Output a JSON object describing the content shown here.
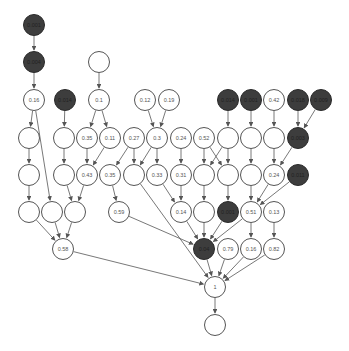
{
  "colors": {
    "light_fill": "#ffffff",
    "dark_fill": "#3d3d3d",
    "stroke": "#555555"
  },
  "nodes": [
    {
      "id": "n0",
      "x": 34,
      "y": 25,
      "label": "0.001",
      "dark": true
    },
    {
      "id": "n1",
      "x": 34,
      "y": 62,
      "label": "0.004",
      "dark": true
    },
    {
      "id": "n2",
      "x": 99,
      "y": 62,
      "label": "",
      "dark": false
    },
    {
      "id": "n3",
      "x": 34,
      "y": 100,
      "label": "0.16",
      "dark": false
    },
    {
      "id": "n4",
      "x": 65,
      "y": 100,
      "label": "0.014",
      "dark": true
    },
    {
      "id": "n5",
      "x": 99,
      "y": 100,
      "label": "0.1",
      "dark": false
    },
    {
      "id": "n6",
      "x": 145,
      "y": 100,
      "label": "0.12",
      "dark": false
    },
    {
      "id": "n7",
      "x": 169,
      "y": 100,
      "label": "0.19",
      "dark": false
    },
    {
      "id": "n8",
      "x": 228,
      "y": 100,
      "label": "0.014",
      "dark": true
    },
    {
      "id": "n9",
      "x": 251,
      "y": 100,
      "label": "0.001",
      "dark": true
    },
    {
      "id": "n10",
      "x": 274,
      "y": 100,
      "label": "0.42",
      "dark": false
    },
    {
      "id": "n11",
      "x": 298,
      "y": 100,
      "label": "0.018",
      "dark": true
    },
    {
      "id": "n12",
      "x": 321,
      "y": 100,
      "label": "0.009",
      "dark": true
    },
    {
      "id": "n13",
      "x": 29,
      "y": 138,
      "label": "",
      "dark": false
    },
    {
      "id": "n14",
      "x": 64,
      "y": 138,
      "label": "",
      "dark": false
    },
    {
      "id": "n15",
      "x": 87,
      "y": 138,
      "label": "0.35",
      "dark": false
    },
    {
      "id": "n16",
      "x": 110,
      "y": 138,
      "label": "0.11",
      "dark": false
    },
    {
      "id": "n17",
      "x": 134,
      "y": 138,
      "label": "0.27",
      "dark": false
    },
    {
      "id": "n18",
      "x": 157,
      "y": 138,
      "label": "0.3",
      "dark": false
    },
    {
      "id": "n19",
      "x": 181,
      "y": 138,
      "label": "0.24",
      "dark": false
    },
    {
      "id": "n20",
      "x": 204,
      "y": 138,
      "label": "0.52",
      "dark": false
    },
    {
      "id": "n21",
      "x": 228,
      "y": 138,
      "label": "",
      "dark": false
    },
    {
      "id": "n22",
      "x": 251,
      "y": 138,
      "label": "",
      "dark": false
    },
    {
      "id": "n23",
      "x": 274,
      "y": 138,
      "label": "",
      "dark": false
    },
    {
      "id": "n24",
      "x": 298,
      "y": 138,
      "label": "0.003",
      "dark": true
    },
    {
      "id": "n25",
      "x": 29,
      "y": 175,
      "label": "",
      "dark": false
    },
    {
      "id": "n26",
      "x": 64,
      "y": 175,
      "label": "",
      "dark": false
    },
    {
      "id": "n27",
      "x": 87,
      "y": 175,
      "label": "0.43",
      "dark": false
    },
    {
      "id": "n28",
      "x": 110,
      "y": 175,
      "label": "0.35",
      "dark": false
    },
    {
      "id": "n29",
      "x": 134,
      "y": 175,
      "label": "",
      "dark": false
    },
    {
      "id": "n30",
      "x": 157,
      "y": 175,
      "label": "0.33",
      "dark": false
    },
    {
      "id": "n31",
      "x": 181,
      "y": 175,
      "label": "0.31",
      "dark": false
    },
    {
      "id": "n32",
      "x": 204,
      "y": 175,
      "label": "",
      "dark": false
    },
    {
      "id": "n33",
      "x": 228,
      "y": 175,
      "label": "",
      "dark": false
    },
    {
      "id": "n34",
      "x": 251,
      "y": 175,
      "label": "",
      "dark": false
    },
    {
      "id": "n35",
      "x": 274,
      "y": 175,
      "label": "0.24",
      "dark": false
    },
    {
      "id": "n36",
      "x": 298,
      "y": 175,
      "label": "0.011",
      "dark": true
    },
    {
      "id": "n37",
      "x": 29,
      "y": 212,
      "label": "",
      "dark": false
    },
    {
      "id": "n38",
      "x": 52,
      "y": 212,
      "label": "",
      "dark": false
    },
    {
      "id": "n39",
      "x": 75,
      "y": 212,
      "label": "",
      "dark": false
    },
    {
      "id": "n40",
      "x": 119,
      "y": 212,
      "label": "0.59",
      "dark": false
    },
    {
      "id": "n41",
      "x": 181,
      "y": 212,
      "label": "0.14",
      "dark": false
    },
    {
      "id": "n42",
      "x": 204,
      "y": 212,
      "label": "",
      "dark": false
    },
    {
      "id": "n43",
      "x": 228,
      "y": 212,
      "label": "0.001",
      "dark": true
    },
    {
      "id": "n44",
      "x": 251,
      "y": 212,
      "label": "0.51",
      "dark": false
    },
    {
      "id": "n45",
      "x": 274,
      "y": 212,
      "label": "0.13",
      "dark": false
    },
    {
      "id": "n46",
      "x": 63,
      "y": 249,
      "label": "0.58",
      "dark": false
    },
    {
      "id": "n47",
      "x": 204,
      "y": 249,
      "label": "0.04",
      "dark": true
    },
    {
      "id": "n48",
      "x": 228,
      "y": 249,
      "label": "0.79",
      "dark": false
    },
    {
      "id": "n49",
      "x": 251,
      "y": 249,
      "label": "0.16",
      "dark": false
    },
    {
      "id": "n50",
      "x": 274,
      "y": 249,
      "label": "0.82",
      "dark": false
    },
    {
      "id": "n51",
      "x": 215,
      "y": 287,
      "label": "1",
      "dark": false
    },
    {
      "id": "n52",
      "x": 215,
      "y": 325,
      "label": "",
      "dark": false
    }
  ],
  "edges": [
    [
      "n0",
      "n1"
    ],
    [
      "n1",
      "n3"
    ],
    [
      "n2",
      "n5"
    ],
    [
      "n3",
      "n13"
    ],
    [
      "n3",
      "n38"
    ],
    [
      "n4",
      "n14"
    ],
    [
      "n5",
      "n15"
    ],
    [
      "n5",
      "n16"
    ],
    [
      "n6",
      "n18"
    ],
    [
      "n7",
      "n18"
    ],
    [
      "n8",
      "n21"
    ],
    [
      "n9",
      "n22"
    ],
    [
      "n10",
      "n23"
    ],
    [
      "n11",
      "n24"
    ],
    [
      "n12",
      "n24"
    ],
    [
      "n13",
      "n25"
    ],
    [
      "n14",
      "n26"
    ],
    [
      "n15",
      "n27"
    ],
    [
      "n16",
      "n27"
    ],
    [
      "n17",
      "n28"
    ],
    [
      "n17",
      "n29"
    ],
    [
      "n18",
      "n29"
    ],
    [
      "n18",
      "n30"
    ],
    [
      "n19",
      "n31"
    ],
    [
      "n20",
      "n32"
    ],
    [
      "n20",
      "n33"
    ],
    [
      "n21",
      "n32"
    ],
    [
      "n21",
      "n33"
    ],
    [
      "n22",
      "n34"
    ],
    [
      "n23",
      "n35"
    ],
    [
      "n24",
      "n35"
    ],
    [
      "n25",
      "n37"
    ],
    [
      "n26",
      "n39"
    ],
    [
      "n27",
      "n39"
    ],
    [
      "n28",
      "n40"
    ],
    [
      "n29",
      "n51"
    ],
    [
      "n30",
      "n41"
    ],
    [
      "n31",
      "n41"
    ],
    [
      "n32",
      "n42"
    ],
    [
      "n33",
      "n43"
    ],
    [
      "n34",
      "n44"
    ],
    [
      "n35",
      "n44"
    ],
    [
      "n36",
      "n44"
    ],
    [
      "n37",
      "n46"
    ],
    [
      "n38",
      "n46"
    ],
    [
      "n39",
      "n46"
    ],
    [
      "n40",
      "n47"
    ],
    [
      "n41",
      "n47"
    ],
    [
      "n42",
      "n47"
    ],
    [
      "n43",
      "n47"
    ],
    [
      "n44",
      "n47"
    ],
    [
      "n44",
      "n49"
    ],
    [
      "n45",
      "n50"
    ],
    [
      "n46",
      "n51"
    ],
    [
      "n47",
      "n51"
    ],
    [
      "n48",
      "n51"
    ],
    [
      "n49",
      "n51"
    ],
    [
      "n50",
      "n51"
    ],
    [
      "n51",
      "n52"
    ]
  ]
}
